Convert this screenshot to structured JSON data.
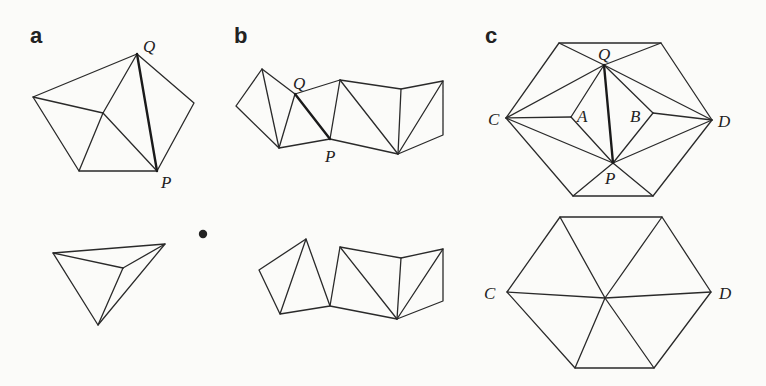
{
  "panels": [
    {
      "id": "a",
      "label": "a",
      "top_vertex_labels": {
        "Q": "Q",
        "P": "P"
      },
      "top_description": "Pentagon triangulated from an interior vertex, with bold diagonal edge QP",
      "bottom_description": "Folded triangular shape (tetrahedron-like outline)"
    },
    {
      "id": "b",
      "label": "b",
      "top_vertex_labels": {
        "Q": "Q",
        "P": "P"
      },
      "top_description": "Strip of triangles forming a zig-zag band with bold edge QP",
      "bottom_description": "Same strip after flipping, edge QP removed"
    },
    {
      "id": "c",
      "label": "c",
      "top_vertex_labels": {
        "Q": "Q",
        "P": "P",
        "A": "A",
        "B": "B",
        "C": "C",
        "D": "D"
      },
      "top_description": "Hexagon triangulation with interior vertices A, B and bold edge QP",
      "bottom_description": "Hexagon with six triangles meeting at a central vertex",
      "bottom_vertex_labels": {
        "C": "C",
        "D": "D"
      }
    }
  ],
  "separator_dot": "•",
  "colors": {
    "stroke": "#2a2a2a",
    "background": "#fbfbf9"
  }
}
